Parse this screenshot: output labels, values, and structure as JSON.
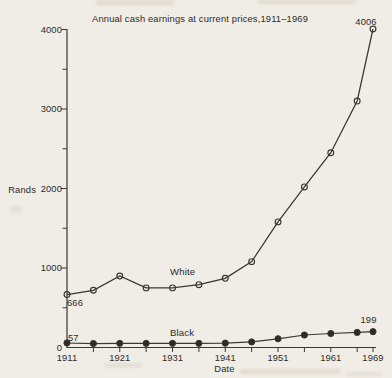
{
  "colors": {
    "paper": "#f0ede6",
    "ink": "#3b3733",
    "text": "#2e2b27"
  },
  "chart_data": {
    "type": "line",
    "title": "Annual cash earnings at current prices,1911–1969",
    "xlabel": "Date",
    "ylabel": "Rands",
    "x": [
      1911,
      1916,
      1921,
      1926,
      1931,
      1936,
      1941,
      1946,
      1951,
      1956,
      1961,
      1966,
      1969
    ],
    "series": [
      {
        "name": "White",
        "marker": "open-circle",
        "values": [
          666,
          720,
          900,
          750,
          750,
          790,
          870,
          1080,
          1580,
          2020,
          2450,
          3100,
          4006
        ]
      },
      {
        "name": "Black",
        "marker": "filled-circle",
        "values": [
          57,
          50,
          52,
          52,
          52,
          52,
          55,
          70,
          110,
          157,
          176,
          190,
          199
        ]
      }
    ],
    "annotations": {
      "white_first": "666",
      "white_last": "4006",
      "black_first": "57",
      "black_last": "199"
    },
    "xlim": [
      1911,
      1969
    ],
    "ylim": [
      0,
      4000
    ],
    "y_ticks_major": [
      0,
      1000,
      2000,
      3000,
      4000
    ],
    "y_ticks_minor": [
      500,
      1500,
      2500,
      3500
    ],
    "x_ticks": [
      1916,
      1921,
      1926,
      1931,
      1936,
      1941,
      1946,
      1951,
      1956,
      1961,
      1966,
      1969
    ],
    "x_tick_labels": [
      1911,
      1921,
      1931,
      1941,
      1951,
      1961,
      1969
    ],
    "grid": false,
    "legend_position": "inline-labels"
  }
}
